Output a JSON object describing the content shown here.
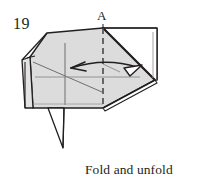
{
  "diagram": {
    "type": "origami-instruction-step",
    "step_number": "19",
    "point_label": "A",
    "caption": {
      "line1": "Fold and unfold",
      "line2": "using A as a guide."
    },
    "colors": {
      "paper_fill": "#dcdcdc",
      "paper_fill_light": "#e6e6e6",
      "paper_white": "#ffffff",
      "outline": "#231f20",
      "crease": "#6e6e6e",
      "dashed_fold_line": "#4a4a4a",
      "background": "#ffffff"
    },
    "elements": {
      "fold_line_name": "vertical dashed valley-fold line through A",
      "arrow_name": "double-headed curved fold-and-unfold arrow",
      "arrow_left_head": "open-line arrowhead pointing left",
      "arrow_right_head": "hollow triangle arrowhead pointing right",
      "left_flap": "narrow layered edge flap on left side",
      "right_flap": "white triangular flap on right side",
      "bottom_spike": "thin downward point below lower edge"
    }
  }
}
